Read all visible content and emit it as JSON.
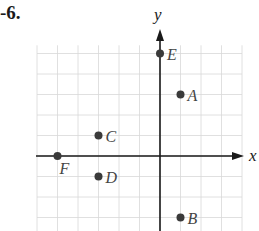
{
  "problem_number": "-6.",
  "chart_data": {
    "type": "scatter",
    "title": "",
    "xlabel": "x",
    "ylabel": "y",
    "xlim": [
      -5,
      4
    ],
    "ylim": [
      -4,
      6
    ],
    "grid": true,
    "grid_step": 1,
    "points": [
      {
        "label": "E",
        "x": 0,
        "y": 5
      },
      {
        "label": "A",
        "x": 1,
        "y": 3
      },
      {
        "label": "C",
        "x": -3,
        "y": 1
      },
      {
        "label": "F",
        "x": -5,
        "y": 0
      },
      {
        "label": "D",
        "x": -3,
        "y": -1
      },
      {
        "label": "B",
        "x": 1,
        "y": -3
      }
    ],
    "colors": {
      "point": "#3a3a3a",
      "axis": "#1a1a1a",
      "grid": "#d8d8d8",
      "label": "#444444"
    }
  }
}
